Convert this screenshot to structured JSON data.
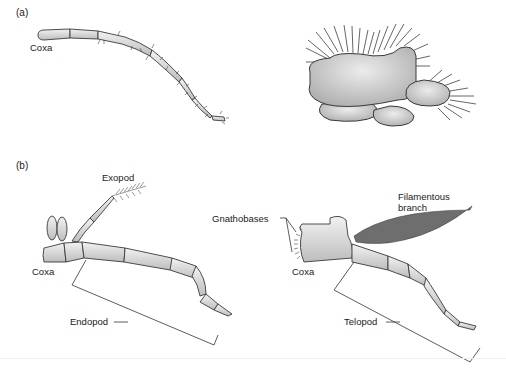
{
  "figure": {
    "panel_a": {
      "label": "(a)",
      "limb_label": "Coxa"
    },
    "panel_b": {
      "label": "(b)",
      "left_limb": {
        "exopod_label": "Exopod",
        "coxa_label": "Coxa",
        "endopod_label": "Endopod"
      },
      "right_limb": {
        "gnathobases_label": "Gnathobases",
        "filamentous_label_line1": "Filamentous",
        "filamentous_label_line2": "branch",
        "coxa_label": "Coxa",
        "telopod_label": "Telopod"
      }
    },
    "colors": {
      "limb_fill": "#dcdcdc",
      "outline": "#3a3a3a",
      "bristle": "#555555",
      "text": "#1a1a1a"
    }
  }
}
